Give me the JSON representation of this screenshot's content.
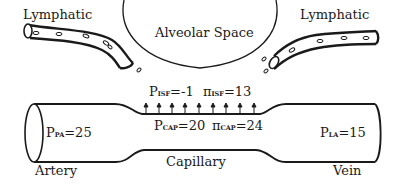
{
  "labels": {
    "lymphatic_left": "Lymphatic",
    "lymphatic_right": "Lymphatic",
    "alveolar_space": "Alveolar Space",
    "artery": "Artery",
    "capillary": "Capillary",
    "vein": "Vein"
  },
  "pressures": {
    "p_pa": {
      "symbol": "P",
      "sub": "PA",
      "value": "=25"
    },
    "p_la": {
      "symbol": "P",
      "sub": "LA",
      "value": "=15"
    },
    "p_isf": {
      "symbol": "P",
      "sub": "ISF",
      "value": "=-1"
    },
    "pi_isf": {
      "symbol": "π",
      "sub": "ISF",
      "value": "=13"
    },
    "p_cap": {
      "symbol": "P",
      "sub": "CAP",
      "value": "=20"
    },
    "pi_cap": {
      "symbol": "π",
      "sub": "CAP",
      "value": "=24"
    }
  },
  "icons": {
    "filtration_arrows": "up-arrow-icon",
    "fluid_droplets": "droplet-icon"
  },
  "colors": {
    "stroke": "#1a1a1a",
    "background": "#ffffff"
  }
}
